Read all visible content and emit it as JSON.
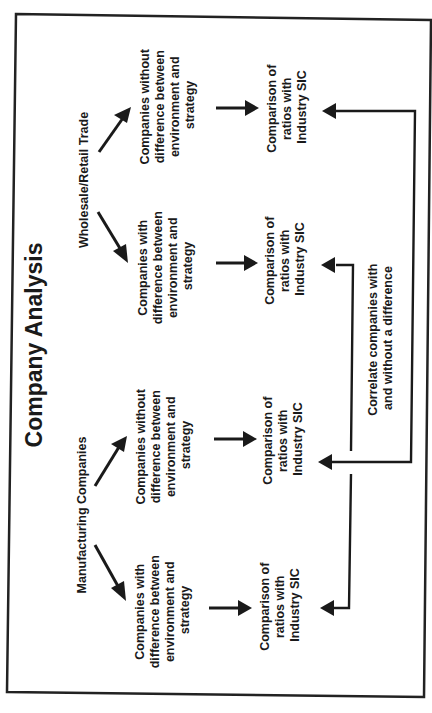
{
  "diagram": {
    "title": "Company Analysis",
    "orientation": "rotated 90° counter-clockwise",
    "groups": [
      {
        "label": "Manufacturing Companies",
        "branches": [
          {
            "label_lines": [
              "Companies with",
              "difference between",
              "environment and",
              "strategy"
            ],
            "result_lines": [
              "Comparison of",
              "ratios with",
              "Industry SIC"
            ]
          },
          {
            "label_lines": [
              "Companies without",
              "difference between",
              "environment and",
              "strategy"
            ],
            "result_lines": [
              "Comparison of",
              "ratios with",
              "Industry SIC"
            ]
          }
        ]
      },
      {
        "label": "Wholesale/Retail Trade",
        "branches": [
          {
            "label_lines": [
              "Companies with",
              "difference between",
              "environment and",
              "strategy"
            ],
            "result_lines": [
              "Comparison of",
              "ratios with",
              "Industry SIC"
            ]
          },
          {
            "label_lines": [
              "Companies without",
              "difference between",
              "environment and",
              "strategy"
            ],
            "result_lines": [
              "Comparison of",
              "ratios with",
              "Industry SIC"
            ]
          }
        ]
      }
    ],
    "correlation": {
      "label_lines": [
        "Correlate companies with",
        "and without a difference"
      ]
    },
    "colors": {
      "ink": "#1a1a1a",
      "background": "#ffffff"
    }
  }
}
